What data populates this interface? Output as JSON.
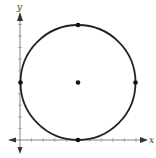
{
  "diagram": {
    "type": "circle-on-coordinate-plane",
    "axes": {
      "x_label": "x",
      "y_label": "y",
      "x_ticks": 10,
      "y_ticks": 10,
      "arrows": "both-directions"
    },
    "circle": {
      "center": [
        5,
        5
      ],
      "radius": 5,
      "stroke_color": "#222222"
    },
    "points": [
      {
        "name": "center",
        "coords": [
          5,
          5
        ]
      },
      {
        "name": "top",
        "coords": [
          5,
          10
        ]
      },
      {
        "name": "bottom",
        "coords": [
          5,
          0
        ]
      },
      {
        "name": "left",
        "coords": [
          0,
          5
        ]
      },
      {
        "name": "right",
        "coords": [
          10,
          5
        ]
      }
    ],
    "colors": {
      "axis": "#555555",
      "circle": "#222222",
      "point": "#111111"
    }
  }
}
